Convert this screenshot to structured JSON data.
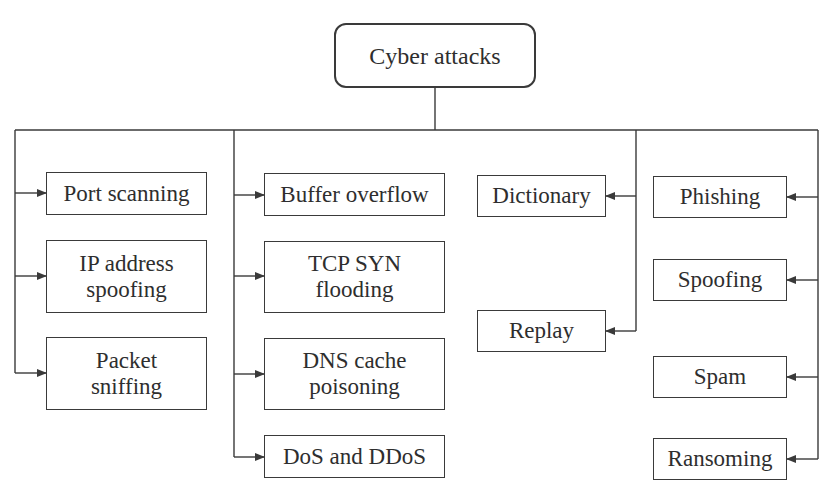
{
  "diagram": {
    "type": "tree",
    "colors": {
      "line": "#3a3a3a",
      "text": "#2e2e2e",
      "background": "#ffffff"
    },
    "root": {
      "label": "Cyber attacks"
    },
    "columns": [
      {
        "id": "col1",
        "arrow_direction": "right",
        "items": [
          {
            "lines": [
              "Port scanning"
            ]
          },
          {
            "lines": [
              "IP address",
              "spoofing"
            ]
          },
          {
            "lines": [
              "Packet",
              "sniffing"
            ]
          }
        ]
      },
      {
        "id": "col2",
        "arrow_direction": "right",
        "items": [
          {
            "lines": [
              "Buffer overflow"
            ]
          },
          {
            "lines": [
              "TCP SYN",
              "flooding"
            ]
          },
          {
            "lines": [
              "DNS cache",
              "poisoning"
            ]
          },
          {
            "lines": [
              "DoS and DDoS"
            ]
          }
        ]
      },
      {
        "id": "col3",
        "arrow_direction": "left",
        "items": [
          {
            "lines": [
              "Dictionary"
            ]
          },
          {
            "lines": [
              "Replay"
            ]
          }
        ]
      },
      {
        "id": "col4",
        "arrow_direction": "left",
        "items": [
          {
            "lines": [
              "Phishing"
            ]
          },
          {
            "lines": [
              "Spoofing"
            ]
          },
          {
            "lines": [
              "Spam"
            ]
          },
          {
            "lines": [
              "Ransoming"
            ]
          }
        ]
      }
    ]
  }
}
